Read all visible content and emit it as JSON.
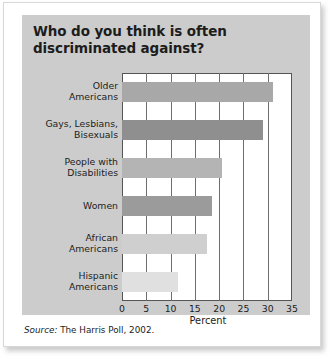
{
  "title": "Who do you think is often discriminated against?",
  "source": {
    "prefix": "Source:",
    "text": "The Harris Poll, 2002."
  },
  "colors": {
    "panel_background": "#cccccc",
    "plot_background": "#ffffff",
    "axis": "#555555",
    "gridline": "#6e6e6e",
    "text": "#1c1c1c",
    "page": "#ffffff"
  },
  "chart_data": {
    "type": "bar",
    "orientation": "horizontal",
    "title": "Who do you think is often discriminated against?",
    "xlabel": "Percent",
    "ylabel": "",
    "xlim": [
      0,
      35
    ],
    "xticks": [
      0,
      5,
      10,
      15,
      20,
      25,
      30,
      35
    ],
    "xtick_labels": [
      "0",
      "5",
      "10",
      "15",
      "20",
      "25",
      "30",
      "35"
    ],
    "grid": "vertical",
    "legend": "none",
    "categories": [
      "Older Americans",
      "Gays, Lesbians, Bisexuals",
      "People with Disabilities",
      "Women",
      "African Americans",
      "Hispanic Americans"
    ],
    "category_lines": [
      [
        "Older",
        "Americans"
      ],
      [
        "Gays, Lesbians,",
        "Bisexuals"
      ],
      [
        "People with",
        "Disabilities"
      ],
      [
        "Women",
        ""
      ],
      [
        "African",
        "Americans"
      ],
      [
        "Hispanic",
        "Americans"
      ]
    ],
    "values": [
      31,
      29,
      20.5,
      18.5,
      17.5,
      11.5
    ],
    "bar_colors": [
      "#a8a8a8",
      "#8f8f8f",
      "#b4b4b4",
      "#9b9b9b",
      "#cfcfcf",
      "#e0e0e0"
    ],
    "units": "percent"
  }
}
